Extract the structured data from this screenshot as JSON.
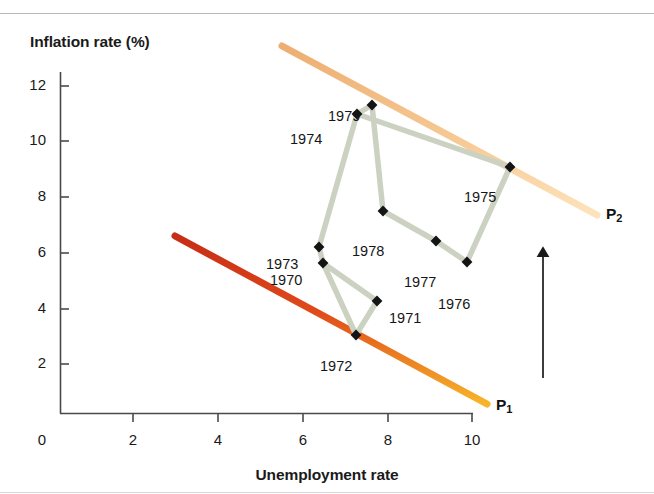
{
  "chart_data": {
    "type": "line",
    "title": "",
    "xlabel": "Unemployment rate",
    "ylabel": "Inflation rate (%)",
    "xlim": [
      0,
      10
    ],
    "ylim": [
      0,
      13
    ],
    "xticks": [
      0,
      2,
      4,
      6,
      8,
      10
    ],
    "yticks": [
      0,
      2,
      4,
      6,
      8,
      10,
      12
    ],
    "xtick_labels": [
      "0",
      "2",
      "4",
      "6",
      "8",
      "10"
    ],
    "ytick_labels": [
      "0",
      "2",
      "4",
      "6",
      "8",
      "10",
      "12"
    ],
    "grid": false,
    "legend": "none",
    "series": [
      {
        "name": "Actual inflation-unemployment path",
        "color": "#ccd2c2",
        "marker": "diamond",
        "marker_color": "#141414",
        "points": [
          {
            "label": "1970",
            "x": 5.0,
            "y": 5.5,
            "px": 323,
            "py": 263,
            "label_px": 270,
            "label_py": 272
          },
          {
            "label": "1971",
            "x": 5.8,
            "y": 4.4,
            "px": 377,
            "py": 301,
            "label_px": 389,
            "label_py": 310
          },
          {
            "label": "1972",
            "x": 5.5,
            "y": 3.2,
            "px": 356,
            "py": 335,
            "label_px": 320,
            "label_py": 358
          },
          {
            "label": "1973",
            "x": 4.9,
            "y": 6.1,
            "px": 319,
            "py": 247,
            "label_px": 266,
            "label_py": 256
          },
          {
            "label": "1974",
            "x": 5.6,
            "y": 11.0,
            "px": 357,
            "py": 114,
            "label_px": 290,
            "label_py": 131
          },
          {
            "label": "1975",
            "x": 8.5,
            "y": 9.2,
            "px": 510,
            "py": 167,
            "label_px": 464,
            "label_py": 189
          },
          {
            "label": "1976",
            "x": 7.7,
            "y": 5.8,
            "px": 467,
            "py": 262,
            "label_px": 438,
            "label_py": 296
          },
          {
            "label": "1977",
            "x": 7.1,
            "y": 6.5,
            "px": 436,
            "py": 241,
            "label_px": 404,
            "label_py": 274
          },
          {
            "label": "1978",
            "x": 6.1,
            "y": 7.6,
            "px": 383,
            "py": 211,
            "label_px": 352,
            "label_py": 243
          },
          {
            "label": "1979",
            "x": 5.9,
            "y": 11.4,
            "px": 372,
            "py": 105,
            "label_px": 328,
            "label_py": 108
          }
        ],
        "path_order": [
          "1970",
          "1971",
          "1972",
          "1970",
          "1973",
          "1974",
          "1975",
          "1976",
          "1977",
          "1978",
          "1979",
          "1974"
        ]
      }
    ],
    "annotations": [
      {
        "name": "phillips-curve-1",
        "label": "P",
        "sub": "1",
        "color_top": "#d6351f",
        "color_bottom": "#f3a424",
        "x1": 175,
        "y1": 236,
        "x2": 487,
        "y2": 404,
        "label_px": 496,
        "label_py": 397
      },
      {
        "name": "phillips-curve-2",
        "label": "P",
        "sub": "2",
        "color_top": "#f0b174",
        "color_bottom": "#fbd9a8",
        "x1": 282,
        "y1": 46,
        "x2": 597,
        "y2": 215,
        "label_px": 606,
        "label_py": 206
      },
      {
        "name": "shift-arrow",
        "label": "",
        "x1": 543,
        "y1": 378,
        "x2": 543,
        "y2": 248
      }
    ],
    "axis_color": "#4a4a4a"
  },
  "labels": {
    "y_axis_title": "Inflation rate (%)",
    "x_axis_title": "Unemployment rate"
  }
}
